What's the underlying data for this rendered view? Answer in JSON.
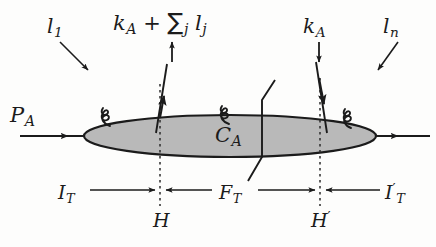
{
  "figure": {
    "type": "feynman-diagram",
    "background_color": "#fdfdfc",
    "ink_color": "#1b1b1b",
    "blob_fill_color": "#b8b8b8",
    "labels": {
      "incoming_parton_left": {
        "base": "l",
        "sub": "1"
      },
      "top_emission": {
        "base": "k",
        "sub": "A",
        "operator": "+",
        "sum": "∑",
        "sum_sub": "j",
        "term_base": "l",
        "term_sub": "j"
      },
      "top_right_momentum": {
        "base": "k",
        "sub": "A"
      },
      "incoming_parton_right": {
        "base": "l",
        "sub": "n"
      },
      "incoming_hadron": {
        "base": "P",
        "sub": "A"
      },
      "blob": {
        "base": "C",
        "sub": "A"
      },
      "region_initial": {
        "base": "I",
        "sub": "T"
      },
      "region_final": {
        "base": "F",
        "sub": "T"
      },
      "region_initial_prime": {
        "base": "I",
        "sub": "T",
        "prime": "′"
      },
      "hard_left": {
        "base": "H"
      },
      "hard_right": {
        "base": "H",
        "prime": "′"
      }
    },
    "geometry": {
      "blob_center": [
        230,
        136
      ],
      "blob_rx": 145,
      "blob_ry": 20,
      "cut_line_x": 262,
      "dashed_line_left_x": 160,
      "dashed_line_right_x": 320,
      "axis_y": 136
    }
  }
}
